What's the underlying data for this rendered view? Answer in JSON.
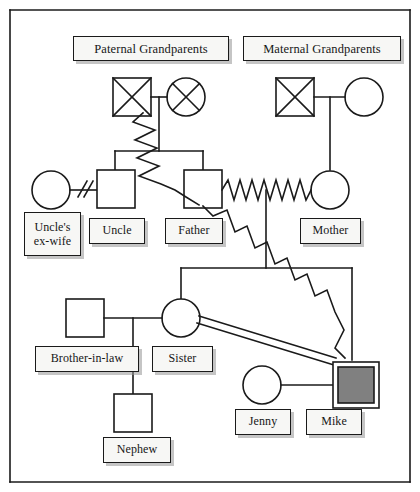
{
  "diagram": {
    "type": "genogram",
    "title_boxes": [
      {
        "id": "paternal-grandparents",
        "label": "Paternal Grandparents"
      },
      {
        "id": "maternal-grandparents",
        "label": "Maternal Grandparents"
      }
    ],
    "person_labels": [
      {
        "id": "uncles-ex-wife",
        "label": "Uncle's\nex-wife"
      },
      {
        "id": "uncle",
        "label": "Uncle"
      },
      {
        "id": "father",
        "label": "Father"
      },
      {
        "id": "mother",
        "label": "Mother"
      },
      {
        "id": "brother-in-law",
        "label": "Brother-in-law"
      },
      {
        "id": "sister",
        "label": "Sister"
      },
      {
        "id": "nephew",
        "label": "Nephew"
      },
      {
        "id": "jenny",
        "label": "Jenny"
      },
      {
        "id": "mike",
        "label": "Mike"
      }
    ],
    "symbols": [
      {
        "id": "paternal-grandfather",
        "shape": "square",
        "status": "deceased",
        "marker": "cross-out"
      },
      {
        "id": "paternal-grandmother",
        "shape": "circle",
        "status": "deceased",
        "marker": "cross-out"
      },
      {
        "id": "maternal-grandfather",
        "shape": "square",
        "status": "deceased",
        "marker": "cross-out"
      },
      {
        "id": "maternal-grandmother",
        "shape": "circle",
        "status": "living",
        "marker": "none"
      },
      {
        "id": "uncles-ex-wife-symbol",
        "shape": "circle",
        "status": "living",
        "marker": "none"
      },
      {
        "id": "uncle-symbol",
        "shape": "square",
        "status": "living",
        "marker": "none"
      },
      {
        "id": "father-symbol",
        "shape": "square",
        "status": "living",
        "marker": "none"
      },
      {
        "id": "mother-symbol",
        "shape": "circle",
        "status": "living",
        "marker": "none"
      },
      {
        "id": "brother-in-law-symbol",
        "shape": "square",
        "status": "living",
        "marker": "none"
      },
      {
        "id": "sister-symbol",
        "shape": "circle",
        "status": "living",
        "marker": "none"
      },
      {
        "id": "nephew-symbol",
        "shape": "square",
        "status": "living",
        "marker": "none"
      },
      {
        "id": "jenny-symbol",
        "shape": "circle",
        "status": "living",
        "marker": "none"
      },
      {
        "id": "mike-symbol",
        "shape": "square",
        "status": "living",
        "marker": "identified-patient",
        "fill": "#808080",
        "double_border": true
      }
    ],
    "relationships": [
      {
        "id": "uncle-divorce",
        "from": "uncles-ex-wife",
        "to": "uncle",
        "style": "divorced-double-slash"
      },
      {
        "id": "father-mother-conflict",
        "from": "father",
        "to": "mother",
        "style": "zigzag-conflict"
      },
      {
        "id": "grandfather-father-conflict",
        "from": "paternal-grandfather",
        "to": "father",
        "style": "zigzag-conflict"
      },
      {
        "id": "father-mike-conflict",
        "from": "father",
        "to": "mike",
        "style": "zigzag-conflict"
      },
      {
        "id": "sister-mike-close",
        "from": "sister",
        "to": "mike",
        "style": "double-line-close"
      },
      {
        "id": "jenny-mike-union",
        "from": "jenny",
        "to": "mike",
        "style": "solid-union"
      },
      {
        "id": "brother-in-law-sister-union",
        "from": "brother-in-law",
        "to": "sister",
        "style": "solid-union"
      }
    ],
    "colors": {
      "stroke": "#1a1a1a",
      "identified_patient_fill": "#808080",
      "label_fill": "#f7f7f5",
      "shadow": "#969696",
      "background": "#ffffff"
    }
  }
}
